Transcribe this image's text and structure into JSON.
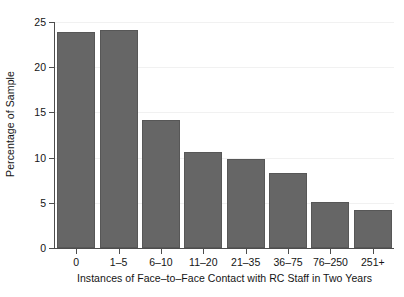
{
  "chart_data": {
    "type": "bar",
    "title": "",
    "xlabel": "Instances of Face–to–Face Contact with RC Staff in Two Years",
    "ylabel": "Percentage of Sample",
    "categories": [
      "0",
      "1–5",
      "6–10",
      "11–20",
      "21–35",
      "36–75",
      "76–250",
      "251+"
    ],
    "values": [
      23.9,
      24.1,
      14.2,
      10.6,
      9.9,
      8.3,
      5.1,
      4.2
    ],
    "ylim": [
      0,
      25
    ],
    "yticks": [
      0,
      5,
      10,
      15,
      20,
      25
    ],
    "ytick_labels": [
      "0",
      "5",
      "10",
      "15",
      "20",
      "25"
    ],
    "grid": "horizontal-faint",
    "legend": "none",
    "bar_color": "#666666",
    "bar_edge_color": "#575757",
    "axis_color": "#4d4d4d",
    "gridline_color": "#f1f1f1",
    "background_color": "#ffffff"
  }
}
